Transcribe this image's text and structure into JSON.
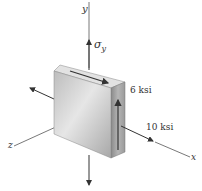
{
  "diagram": {
    "type": "stress-element",
    "axes": {
      "x": "x",
      "y": "y",
      "z": "z"
    },
    "labels": {
      "sigma_y": "σ",
      "sigma_y_sub": "y",
      "shear": "6 ksi",
      "normal_x": "10 ksi"
    },
    "colors": {
      "axis": "#555555",
      "block_front": "#cfcfcf",
      "block_top": "#e0e0e0",
      "block_side": "#9a9a9a",
      "arrow": "#333333"
    }
  }
}
